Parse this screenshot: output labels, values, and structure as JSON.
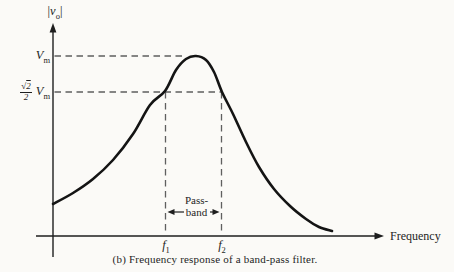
{
  "figure": {
    "caption": "(b)  Frequency response of a band-pass filter."
  },
  "y_axis": {
    "title": {
      "open": "|",
      "symbol": "v",
      "subscript": "o",
      "close": "|"
    },
    "tick_vm": {
      "base": "V",
      "sub": "m"
    },
    "tick_half": {
      "radical": "√",
      "radicand": "2",
      "den": "2",
      "base": "V",
      "sub": "m"
    }
  },
  "x_axis": {
    "title": "Frequency",
    "tick_f1": {
      "base": "f",
      "sub": "1"
    },
    "tick_f2": {
      "base": "f",
      "sub": "2"
    }
  },
  "annotations": {
    "passband_line1": "Pass-",
    "passband_line2": "band"
  },
  "palette": {
    "paper": "#fbfaf7",
    "ink": "#1e1e1e",
    "dash": "#5f5f5f"
  },
  "chart_data": {
    "type": "line",
    "title": "Frequency response of a band-pass filter",
    "xlabel": "Frequency",
    "ylabel": "|v_o|",
    "x_tick_labels": [
      "f_1",
      "f_2"
    ],
    "y_tick_labels": [
      "V_m",
      "(√2/2) V_m"
    ],
    "grid": false,
    "key_points": {
      "peak": {
        "x": "center frequency between f_1 and f_2",
        "y": "V_m (normalized 1.0)"
      },
      "half_power_points": [
        {
          "x": "f_1",
          "y": "(√2/2) V_m ≈ 0.707 V_m"
        },
        {
          "x": "f_2",
          "y": "(√2/2) V_m ≈ 0.707 V_m"
        }
      ],
      "passband": {
        "from": "f_1",
        "to": "f_2"
      }
    },
    "layout_px": {
      "y_axis": {
        "x": 53,
        "top": 23,
        "bottom": 257
      },
      "x_axis": {
        "y": 236,
        "left": 36,
        "right": 384
      },
      "vm_level_y": 56,
      "half_level_y": 92,
      "vm_dash_end_x": 186,
      "f1_x": 165.5,
      "f2_x": 221.5,
      "passband": {
        "y": 212,
        "left_tip": 167.5,
        "left_tail": 184,
        "right_tip": 219.5,
        "right_tail": 210
      }
    },
    "curve_points_px": [
      [
        53,
        204
      ],
      [
        73,
        193
      ],
      [
        93,
        179
      ],
      [
        113,
        160
      ],
      [
        133,
        134
      ],
      [
        150,
        105
      ],
      [
        165,
        91
      ],
      [
        176,
        70
      ],
      [
        186,
        59
      ],
      [
        196,
        56
      ],
      [
        206,
        60
      ],
      [
        214,
        72
      ],
      [
        222,
        92
      ],
      [
        233,
        114
      ],
      [
        246,
        142
      ],
      [
        259,
        167
      ],
      [
        274,
        189
      ],
      [
        290,
        206
      ],
      [
        306,
        219
      ],
      [
        319,
        227
      ],
      [
        332,
        231
      ]
    ]
  }
}
